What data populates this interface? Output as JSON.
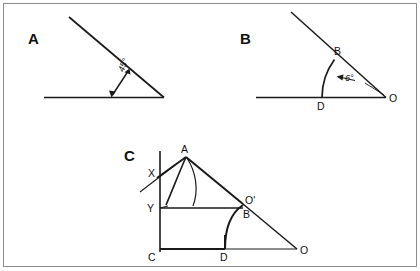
{
  "figure": {
    "border_color": "#8d8d8d",
    "ink_color": "#1a1a1a",
    "background": "#ffffff"
  },
  "panels": [
    {
      "letter": "A",
      "description": "Angle of 45 degrees formed by a horizontal ray and a descending oblique ray meeting at a right-hand vertex, with a double-headed arrow marking the opening.",
      "angle_label": "45°",
      "vertex_labels": []
    },
    {
      "letter": "B",
      "description": "Angle of 6 degrees at vertex O between horizontal ray OD and oblique ray OB, with an arc from D to B and a leader arrow to the label.",
      "angle_label": "6°",
      "vertex_labels": [
        "B",
        "D",
        "O"
      ]
    },
    {
      "letter": "C",
      "description": "Construction diagram with vertical axis through X and Y, point A at top, rectangle C-D up to Y and O-prime, arcs from A and from D, and ray to O at lower right.",
      "angle_label": "",
      "vertex_labels": [
        "A",
        "X",
        "Y",
        "O'",
        "B",
        "C",
        "D",
        "O"
      ]
    }
  ],
  "labels": {
    "panel_a_letter": "A",
    "panel_a_angle": "45°",
    "panel_b_letter": "B",
    "panel_b_angle": "6°",
    "panel_b_point_b": "B",
    "panel_b_point_d": "D",
    "panel_b_point_o": "O",
    "panel_c_letter": "C",
    "panel_c_point_a": "A",
    "panel_c_point_x": "X",
    "panel_c_point_y": "Y",
    "panel_c_point_oprime": "O'",
    "panel_c_point_b": "B",
    "panel_c_point_c": "C",
    "panel_c_point_d": "D",
    "panel_c_point_o": "O"
  }
}
